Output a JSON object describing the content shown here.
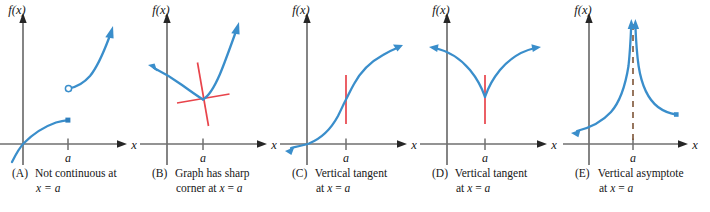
{
  "figure": {
    "axis_color": "#6f6f6f",
    "arrow_color": "#262626",
    "curve_color": "#3a8ecb",
    "tangent_color": "#e8444b",
    "asymptote_color": "#8a5a3a",
    "label_y": "f(x)",
    "label_x": "x",
    "tick_label": "a"
  },
  "panels": [
    {
      "id": "A",
      "tag": "(A)",
      "caption_line1": "Not continuous at",
      "caption_line2": "x = a",
      "axis_y_label": "f(x)",
      "axis_x_label": "x",
      "tick_label": "a",
      "description": "Jump discontinuity: lower branch ends with a solid point, upper branch begins with an open circle at x = a",
      "markers": [
        {
          "kind": "closed-point",
          "at": "end-of-lower-branch"
        },
        {
          "kind": "open-point",
          "at": "start-of-upper-branch"
        }
      ]
    },
    {
      "id": "B",
      "tag": "(B)",
      "caption_line1": "Graph has sharp",
      "caption_line2": "corner at x = a",
      "axis_y_label": "f(x)",
      "axis_x_label": "x",
      "tick_label": "a",
      "description": "Curve descends from upper left to a sharp corner at x = a then rises steeply; two red secant/tangent lines cross at the corner",
      "markers": [
        {
          "kind": "tangent-line",
          "orientation": "steep"
        },
        {
          "kind": "tangent-line",
          "orientation": "shallow"
        }
      ]
    },
    {
      "id": "C",
      "tag": "(C)",
      "caption_line1": "Vertical tangent",
      "caption_line2": "at x = a",
      "axis_y_label": "f(x)",
      "axis_x_label": "x",
      "tick_label": "a",
      "description": "Increasing S-shaped curve (cube-root type) with a vertical red tangent segment at x = a",
      "markers": [
        {
          "kind": "vertical-tangent",
          "at": "x = a"
        }
      ]
    },
    {
      "id": "D",
      "tag": "(D)",
      "caption_line1": "Vertical tangent",
      "caption_line2": "at x = a",
      "axis_y_label": "f(x)",
      "axis_x_label": "x",
      "tick_label": "a",
      "description": "Cusp shaped curve with minimum at x = a and a vertical red tangent segment through the cusp",
      "markers": [
        {
          "kind": "vertical-tangent",
          "at": "x = a"
        }
      ]
    },
    {
      "id": "E",
      "tag": "(E)",
      "caption_line1": "Vertical asymptote",
      "caption_line2": "at x = a",
      "axis_y_label": "f(x)",
      "axis_x_label": "x",
      "tick_label": "a",
      "description": "Curve rising to +infinity on both sides of x = a with a dashed vertical asymptote at x = a",
      "markers": [
        {
          "kind": "dashed-asymptote",
          "at": "x = a"
        }
      ]
    }
  ]
}
